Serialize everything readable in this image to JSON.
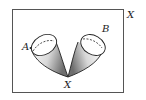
{
  "diagram": {
    "space_label": "X",
    "point_label": "X",
    "cone_a_label": "A",
    "cone_b_label": "B",
    "colors": {
      "stroke": "#222222",
      "frame": "#555555",
      "shade_dark": "#7a7a7a",
      "shade_light": "#f4f4f4"
    }
  }
}
